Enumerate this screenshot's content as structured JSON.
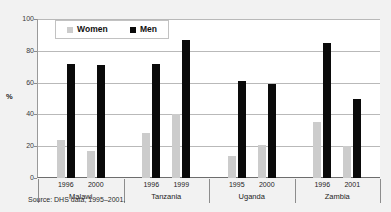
{
  "chart_data": {
    "type": "bar",
    "title": "",
    "subtitle": "",
    "xlabel": "",
    "ylabel": "%",
    "ylim": [
      0,
      100
    ],
    "yticks": [
      0,
      20,
      40,
      60,
      80,
      100
    ],
    "ytick_labels": [
      "0",
      "20",
      "40",
      "60",
      "80",
      "100"
    ],
    "grid": true,
    "legend_position": "top-left-inside",
    "categories": [
      "Malawi 1996",
      "Malawi 2000",
      "Tanzania 1996",
      "Tanzania 1999",
      "Uganda 1995",
      "Uganda 2000",
      "Zambia 1996",
      "Zambia 2001"
    ],
    "groups": [
      {
        "country": "Malawi",
        "years": [
          "1996",
          "2000"
        ],
        "women": [
          24,
          17
        ],
        "men": [
          72,
          71
        ]
      },
      {
        "country": "Tanzania",
        "years": [
          "1996",
          "1999"
        ],
        "women": [
          28,
          40
        ],
        "men": [
          72,
          87
        ]
      },
      {
        "country": "Uganda",
        "years": [
          "1995",
          "2000"
        ],
        "women": [
          14,
          21
        ],
        "men": [
          61,
          59
        ]
      },
      {
        "country": "Zambia",
        "years": [
          "1996",
          "2001"
        ],
        "women": [
          35,
          20
        ],
        "men": [
          85,
          50
        ]
      }
    ],
    "series": [
      {
        "name": "Women",
        "color": "#cccccc",
        "values": [
          24,
          17,
          28,
          40,
          14,
          21,
          35,
          20
        ]
      },
      {
        "name": "Men",
        "color": "#0a0a0a",
        "values": [
          72,
          71,
          72,
          87,
          61,
          59,
          85,
          50
        ]
      }
    ],
    "annotations": [
      "Source: DHS data, 1995–2001."
    ]
  },
  "legend": {
    "items": [
      {
        "label": "Women",
        "color": "#cccccc"
      },
      {
        "label": "Men",
        "color": "#0a0a0a"
      }
    ]
  },
  "axis": {
    "y_title": "%"
  },
  "footer": {
    "source": "Source: DHS data, 1995–2001."
  },
  "colors": {
    "women": "#cccccc",
    "men": "#0a0a0a",
    "background": "#f2f2f2",
    "plot_background": "#ffffff",
    "gridline": "#b9b9b9",
    "axis": "#6d6d6d"
  }
}
